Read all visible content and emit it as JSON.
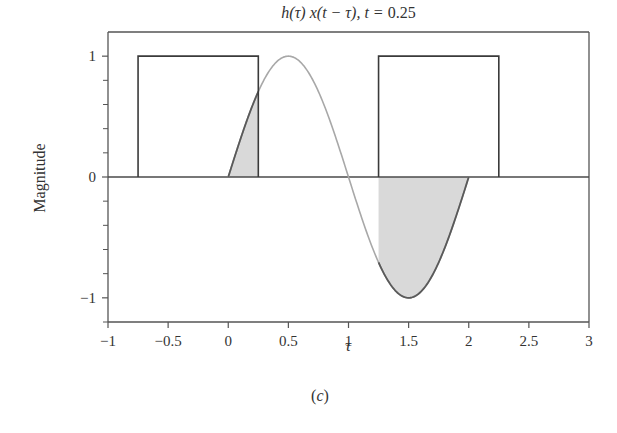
{
  "figure": {
    "title_parts": {
      "expr": "h(τ) x(t − τ), t = ",
      "value": "0.25"
    },
    "caption_open": "(",
    "caption_letter": "c",
    "caption_close": ")"
  },
  "colors": {
    "axis": "#555555",
    "rect": "#3a3a3a",
    "curve_shaded_edge": "#5a5a5a",
    "curve_unshaded": "#a8a8a8",
    "fill": "#d9d9d9",
    "zero_line": "#4a4a4a"
  },
  "chart_data": {
    "type": "line",
    "title": "h(τ) x(t − τ), t = 0.25",
    "xlabel": "τ",
    "ylabel": "Magnitude",
    "caption": "(c)",
    "xlim": [
      -1,
      3
    ],
    "ylim": [
      -1.2,
      1.2
    ],
    "x_ticks": [
      -1,
      -0.5,
      0,
      0.5,
      1,
      1.5,
      2,
      2.5,
      3
    ],
    "x_tick_labels": [
      "−1",
      "−0.5",
      "0",
      "0.5",
      "1",
      "1.5",
      "2",
      "2.5",
      "3"
    ],
    "y_ticks_major": [
      -1,
      0,
      1
    ],
    "y_tick_labels": [
      "−1",
      "0",
      "1"
    ],
    "y_ticks_minor": [
      -1.2,
      -0.8,
      -0.6,
      -0.4,
      -0.2,
      0.2,
      0.4,
      0.6,
      0.8
    ],
    "grid": false,
    "legend": null,
    "series": [
      {
        "name": "x(t − τ) pulse 1",
        "kind": "rectangle",
        "x_start": -0.75,
        "x_end": 0.25,
        "height": 1
      },
      {
        "name": "x(t − τ) pulse 2",
        "kind": "rectangle",
        "x_start": 1.25,
        "x_end": 2.25,
        "height": 1
      },
      {
        "name": "h(τ) = sin(πτ)",
        "kind": "function",
        "expression": "sin(pi*tau)",
        "x_start": 0,
        "x_end": 2,
        "samples": [
          {
            "x": 0,
            "y": 0
          },
          {
            "x": 0.25,
            "y": 0.707
          },
          {
            "x": 0.5,
            "y": 1
          },
          {
            "x": 0.75,
            "y": 0.707
          },
          {
            "x": 1,
            "y": 0
          },
          {
            "x": 1.25,
            "y": -0.707
          },
          {
            "x": 1.5,
            "y": -1
          },
          {
            "x": 1.75,
            "y": -0.707
          },
          {
            "x": 2,
            "y": 0
          }
        ]
      }
    ],
    "shaded_regions": [
      {
        "x_start": 0,
        "x_end": 0.25,
        "description": "product area, positive"
      },
      {
        "x_start": 1.25,
        "x_end": 2,
        "description": "product area, negative"
      }
    ],
    "plot_box_px": {
      "left": 108,
      "top": 32,
      "right": 589,
      "bottom": 322
    }
  }
}
